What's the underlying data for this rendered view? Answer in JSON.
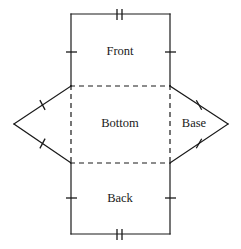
{
  "figure": {
    "background_color": "#ffffff",
    "stroke_color": "#1a1a1a",
    "width": 241,
    "height": 249
  },
  "labels": {
    "front": "Front",
    "bottom": "Bottom",
    "back": "Back",
    "base": "Base"
  },
  "geometry": {
    "rect_left_x": 71,
    "rect_right_x": 170,
    "top_y": 14,
    "upper_fold_y": 86,
    "lower_fold_y": 163,
    "bottom_y": 234,
    "left_apex_x": 14,
    "right_apex_x": 228,
    "apex_y": 124
  },
  "label_positions": {
    "front": {
      "x": 120,
      "y": 52
    },
    "bottom": {
      "x": 120,
      "y": 124
    },
    "back": {
      "x": 120,
      "y": 199
    },
    "base": {
      "x": 194,
      "y": 124
    }
  },
  "edges": [
    {
      "name": "front-top",
      "style": "solid",
      "ticks": 2,
      "x1": 71,
      "y1": 14,
      "x2": 170,
      "y2": 14
    },
    {
      "name": "front-left",
      "style": "solid",
      "ticks": 1,
      "x1": 71,
      "y1": 14,
      "x2": 71,
      "y2": 86
    },
    {
      "name": "front-right",
      "style": "solid",
      "ticks": 1,
      "x1": 170,
      "y1": 14,
      "x2": 170,
      "y2": 86
    },
    {
      "name": "bottom-top-fold",
      "style": "dashed",
      "ticks": 0,
      "x1": 71,
      "y1": 86,
      "x2": 170,
      "y2": 86
    },
    {
      "name": "bottom-left-fold",
      "style": "dashed",
      "ticks": 0,
      "x1": 71,
      "y1": 86,
      "x2": 71,
      "y2": 163
    },
    {
      "name": "bottom-right-fold",
      "style": "dashed",
      "ticks": 0,
      "x1": 170,
      "y1": 86,
      "x2": 170,
      "y2": 163
    },
    {
      "name": "bottom-bottom-fold",
      "style": "dashed",
      "ticks": 0,
      "x1": 71,
      "y1": 163,
      "x2": 170,
      "y2": 163
    },
    {
      "name": "back-left",
      "style": "solid",
      "ticks": 1,
      "x1": 71,
      "y1": 163,
      "x2": 71,
      "y2": 234
    },
    {
      "name": "back-right",
      "style": "solid",
      "ticks": 1,
      "x1": 170,
      "y1": 163,
      "x2": 170,
      "y2": 234
    },
    {
      "name": "back-bottom",
      "style": "solid",
      "ticks": 2,
      "x1": 71,
      "y1": 234,
      "x2": 170,
      "y2": 234
    },
    {
      "name": "left-upper-slant",
      "style": "solid",
      "ticks": 1,
      "x1": 71,
      "y1": 86,
      "x2": 14,
      "y2": 124
    },
    {
      "name": "left-lower-slant",
      "style": "solid",
      "ticks": 1,
      "x1": 14,
      "y1": 124,
      "x2": 71,
      "y2": 163
    },
    {
      "name": "right-upper-slant",
      "style": "solid",
      "ticks": 1,
      "x1": 170,
      "y1": 86,
      "x2": 228,
      "y2": 124
    },
    {
      "name": "right-lower-slant",
      "style": "solid",
      "ticks": 1,
      "x1": 228,
      "y1": 124,
      "x2": 170,
      "y2": 163
    }
  ],
  "tick_marks": [
    {
      "name": "tick-front-top-a",
      "x1": 117,
      "y1": 9,
      "x2": 117,
      "y2": 20
    },
    {
      "name": "tick-front-top-b",
      "x1": 122,
      "y1": 9,
      "x2": 122,
      "y2": 20
    },
    {
      "name": "tick-front-left",
      "x1": 66,
      "y1": 52,
      "x2": 77,
      "y2": 52
    },
    {
      "name": "tick-front-right",
      "x1": 165,
      "y1": 52,
      "x2": 176,
      "y2": 52
    },
    {
      "name": "tick-back-left",
      "x1": 66,
      "y1": 198,
      "x2": 77,
      "y2": 198
    },
    {
      "name": "tick-back-right",
      "x1": 165,
      "y1": 198,
      "x2": 176,
      "y2": 198
    },
    {
      "name": "tick-back-bottom-a",
      "x1": 117,
      "y1": 229,
      "x2": 117,
      "y2": 240
    },
    {
      "name": "tick-back-bottom-b",
      "x1": 122,
      "y1": 229,
      "x2": 122,
      "y2": 240
    },
    {
      "name": "tick-left-upper-slant",
      "x1": 39.9,
      "y1": 100.1,
      "x2": 45.1,
      "y2": 109.9
    },
    {
      "name": "tick-left-lower-slant",
      "x1": 39.9,
      "y1": 148.4,
      "x2": 45.1,
      "y2": 138.6
    },
    {
      "name": "tick-right-upper-slant",
      "x1": 196.3,
      "y1": 100.3,
      "x2": 201.7,
      "y2": 109.7
    },
    {
      "name": "tick-right-lower-slant",
      "x1": 196.3,
      "y1": 148.2,
      "x2": 201.7,
      "y2": 138.8
    }
  ]
}
